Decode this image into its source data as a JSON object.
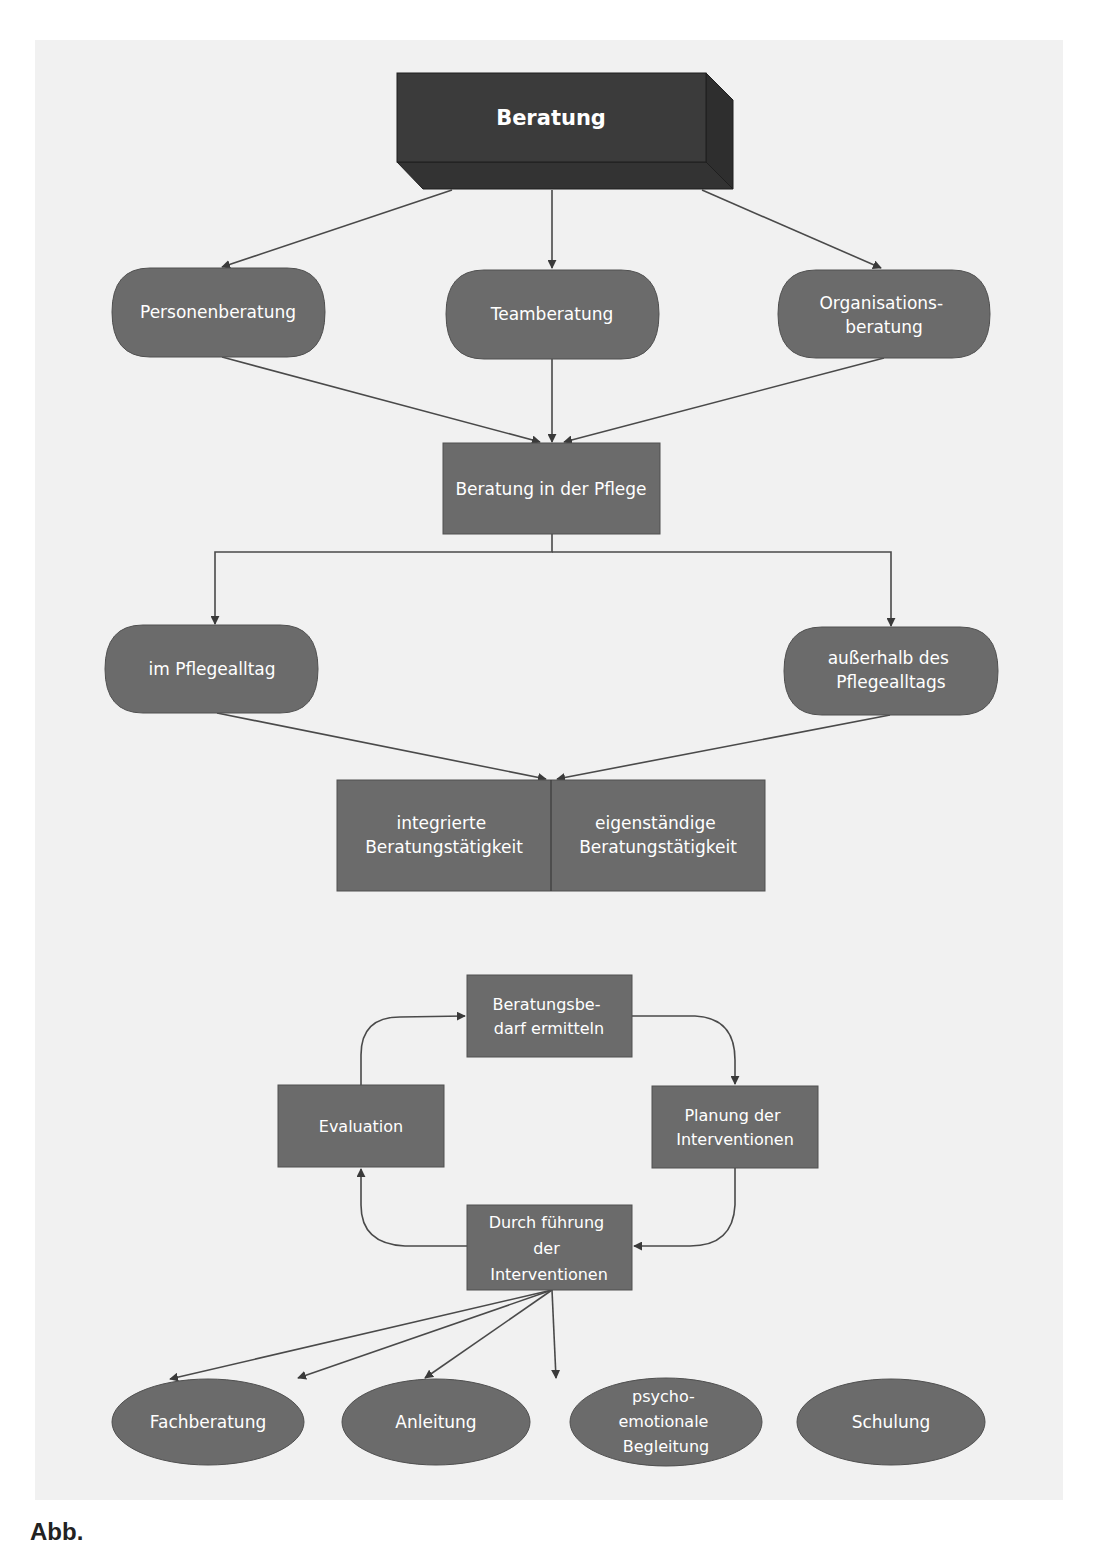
{
  "colors": {
    "background": "#ffffff",
    "panel": "#f1f1f1",
    "root_front": "#3b3b3b",
    "root_side": "#2e2e2e",
    "root_bottom": "#333333",
    "node_fill": "#6b6b6b",
    "node_stroke": "#505050",
    "edge": "#4a4a4a",
    "text": "#ffffff"
  },
  "nodes": {
    "root": {
      "label": "Beratung"
    },
    "personenberatung": {
      "lines": [
        "Personenberatung"
      ]
    },
    "teamberatung": {
      "lines": [
        "Teamberatung"
      ]
    },
    "organisationsberatung": {
      "lines": [
        "Organisations-",
        "beratung"
      ]
    },
    "beratung_pflege": {
      "lines": [
        "Beratung in der Pflege"
      ]
    },
    "im_pflegealltag": {
      "lines": [
        "im Pflegealltag"
      ]
    },
    "ausserhalb": {
      "lines": [
        "außerhalb des",
        "Pflegealltags"
      ]
    },
    "integrierte": {
      "lines": [
        "integrierte",
        "Beratungstätigkeit"
      ]
    },
    "eigenstaendige": {
      "lines": [
        "eigenständige",
        "Beratungstätigkeit"
      ]
    },
    "bedarf": {
      "lines": [
        "Beratungsbe-",
        "darf ermitteln"
      ]
    },
    "evaluation": {
      "lines": [
        "Evaluation"
      ]
    },
    "planung": {
      "lines": [
        "Planung der",
        "Interventionen"
      ]
    },
    "durchfuehrung": {
      "lines": [
        "Durch führung",
        "der",
        "Interventionen"
      ]
    },
    "fachberatung": {
      "lines": [
        "Fachberatung"
      ]
    },
    "anleitung": {
      "lines": [
        "Anleitung"
      ]
    },
    "psycho": {
      "lines": [
        "psycho-",
        "emotionale",
        "Begleitung"
      ]
    },
    "schulung": {
      "lines": [
        "Schulung"
      ]
    }
  },
  "caption": {
    "text": "Abb."
  }
}
